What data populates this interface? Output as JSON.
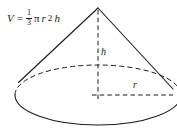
{
  "figure": {
    "shape": "cone",
    "stroke_color": "#1a1a1a",
    "background_color": "#ffffff",
    "formula": {
      "lhs": "V",
      "equals": "=",
      "fraction_numerator": "1",
      "fraction_denominator": "3",
      "pi": "π",
      "radius_symbol": "r",
      "radius_exponent": "2",
      "height_symbol": "h",
      "full_text": "V = 1/3 πr²h"
    },
    "labels": {
      "height": "h",
      "radius": "r"
    },
    "geometry": {
      "apex": [
        98,
        8
      ],
      "base_center": [
        98,
        95
      ],
      "base_rx": 83,
      "base_ry": 30,
      "left_tangent": [
        19,
        81
      ],
      "right_tangent": [
        172,
        88
      ],
      "height_line": [
        [
          98,
          8
        ],
        [
          98,
          95
        ]
      ],
      "radius_line": [
        [
          98,
          95
        ],
        [
          172,
          95
        ]
      ]
    }
  }
}
